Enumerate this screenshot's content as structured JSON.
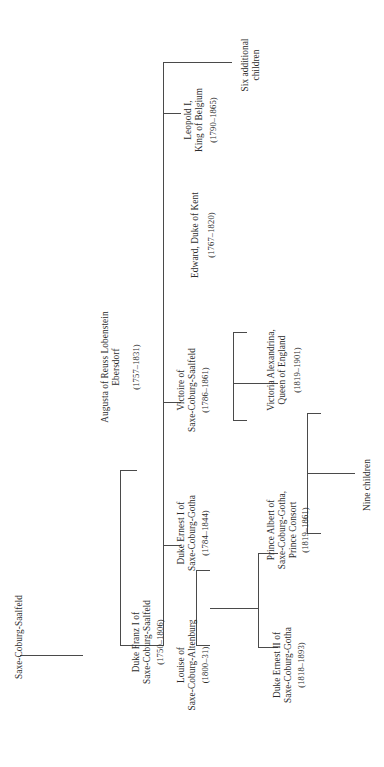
{
  "diagram": {
    "title": "Saxe-Coburg-Saalfeld",
    "type": "genealogical-family-tree",
    "orientation": "rotated-90-counterclockwise",
    "line_color": "#4a4a4a",
    "text_color": "#2b2b2b",
    "background_color": "#ffffff"
  },
  "root": {
    "label": "Saxe-Coburg-Saalfeld"
  },
  "people": {
    "franz": {
      "name_line1": "Duke Franz I of",
      "name_line2": "Saxe-Coburg-Saalfeld",
      "dates": "(1750–1806)"
    },
    "augusta": {
      "name_line1": "Augusta of Reuss Lobenstein",
      "name_line2": "Ebersdorf",
      "dates": "(1757–1831)"
    },
    "ernest1": {
      "name_line1": "Duke Ernest I of",
      "name_line2": "Saxe-Coburg-Gotha",
      "dates": "(1784–1844)"
    },
    "louise": {
      "name_line1": "Louise of",
      "name_line2": "Saxe-Coburg-Altenburg",
      "dates": "(1800–31)"
    },
    "victoire": {
      "name_line1": "Victoire of",
      "name_line2": "Saxe-Coburg-Saalfeld",
      "dates": "(1786–1861)"
    },
    "edward": {
      "name_line1": "Edward, Duke of Kent",
      "dates": "(1767–1820)"
    },
    "leopold": {
      "name_line1": "Leopold I,",
      "name_line2": "King of Belgium",
      "dates": "(1790–1865)"
    },
    "ernest2": {
      "name_line1": "Duke Ernest II of",
      "name_line2": "Saxe-Coburg-Gotha",
      "dates": "(1818–1893)"
    },
    "albert": {
      "name_line1": "Prince Albert of",
      "name_line2": "Saxe-Coburg-Gotha,",
      "name_line3": "Prince Consort",
      "dates": "(1819–1861)"
    },
    "victoria": {
      "name_line1": "Victoria Alexandrina,",
      "name_line2": "Queen of England",
      "dates": "(1819–1901)"
    }
  },
  "groups": {
    "six_additional": {
      "line1": "Six additional",
      "line2": "children"
    },
    "nine_children": {
      "line1": "Nine children"
    }
  }
}
